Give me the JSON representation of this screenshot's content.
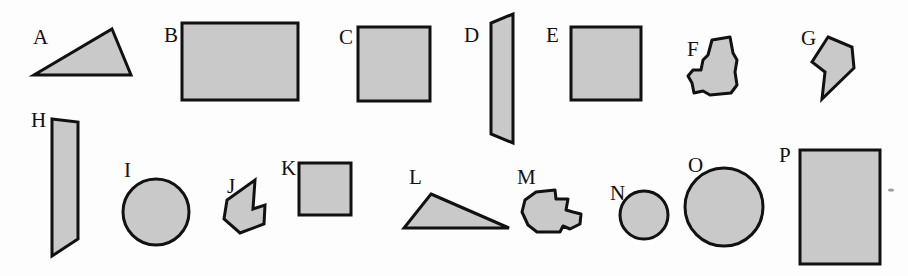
{
  "figure": {
    "background_color": "#fdfdfd",
    "fill_color": "#c9c9c9",
    "stroke_color": "#111111",
    "width": 908,
    "height": 276
  },
  "shapes": [
    {
      "label": "A",
      "kind": "triangle",
      "label_x": 33,
      "label_y": 44,
      "points": "112,29 131,75 34,75",
      "cx": 92,
      "cy": 60
    },
    {
      "label": "B",
      "kind": "rectangle",
      "label_x": 164,
      "label_y": 42,
      "points": "182,23 298,23 298,100 182,100",
      "cx": 240,
      "cy": 61
    },
    {
      "label": "C",
      "kind": "square",
      "label_x": 339,
      "label_y": 44,
      "points": "358,27 430,27 430,101 358,101",
      "cx": 394,
      "cy": 64
    },
    {
      "label": "D",
      "kind": "quadrilateral",
      "label_x": 464,
      "label_y": 42,
      "points": "513,14 513,143 491,134 491,23",
      "cx": 502,
      "cy": 78
    },
    {
      "label": "E",
      "kind": "square",
      "label_x": 546,
      "label_y": 42,
      "points": "571,27 641,27 641,100 571,100",
      "cx": 606,
      "cy": 63
    },
    {
      "label": "F",
      "kind": "blob",
      "label_x": 687,
      "label_y": 56,
      "points": "712,40 730,37 733,53 737,60 735,72 737,85 731,93 710,95 703,91 694,93 692,83 688,76 693,70 701,70 703,60 708,55",
      "cx": 714,
      "cy": 66
    },
    {
      "label": "G",
      "kind": "polygon",
      "label_x": 801,
      "label_y": 45,
      "points": "828,37 852,47 854,68 822,99 825,72 812,62",
      "cx": 834,
      "cy": 62
    },
    {
      "label": "H",
      "kind": "quadrilateral",
      "label_x": 31,
      "label_y": 127,
      "points": "52,119 78,122 78,239 52,256",
      "cx": 65,
      "cy": 187
    },
    {
      "label": "I",
      "kind": "circle",
      "label_x": 124,
      "label_y": 177,
      "cx": 156,
      "cy": 212,
      "r": 33
    },
    {
      "label": "J",
      "kind": "polygon",
      "label_x": 227,
      "label_y": 193,
      "points": "255,180 253,209 265,205 264,224 240,233 224,219 227,200",
      "cx": 246,
      "cy": 207
    },
    {
      "label": "K",
      "kind": "square",
      "label_x": 281,
      "label_y": 175,
      "points": "299,163 351,163 351,215 299,215",
      "cx": 325,
      "cy": 189
    },
    {
      "label": "L",
      "kind": "triangle",
      "label_x": 409,
      "label_y": 184,
      "points": "431,194 509,228 404,228",
      "cx": 448,
      "cy": 217
    },
    {
      "label": "M",
      "kind": "blob",
      "label_x": 517,
      "label_y": 184,
      "points": "536,192 555,190 556,199 568,199 566,210 573,212 581,214 580,224 570,229 563,226 560,232 537,232 528,225 522,212 525,200",
      "cx": 550,
      "cy": 210
    },
    {
      "label": "N",
      "kind": "circle",
      "label_x": 610,
      "label_y": 200,
      "cx": 644,
      "cy": 215,
      "r": 24
    },
    {
      "label": "O",
      "kind": "circle",
      "label_x": 688,
      "label_y": 172,
      "cx": 724,
      "cy": 207,
      "r": 39
    },
    {
      "label": "P",
      "kind": "rectangle",
      "label_x": 779,
      "label_y": 162,
      "points": "800,150 880,150 880,264 800,264",
      "cx": 840,
      "cy": 207
    }
  ],
  "speck": {
    "name": "ink-speck",
    "cx": 891,
    "cy": 190,
    "rx": 3,
    "ry": 1.6
  }
}
